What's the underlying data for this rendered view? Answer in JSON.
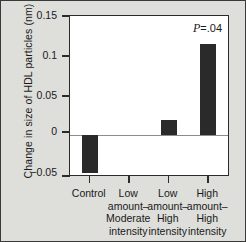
{
  "chart_data": {
    "type": "bar",
    "title": "",
    "xlabel": "",
    "ylabel": "Change in size of HDL particles (nm)",
    "categories": [
      "Control",
      "Low amount–Moderate intensity",
      "Low amount–High intensity",
      "High amount–High intensity"
    ],
    "category_lines": [
      [
        "Control"
      ],
      [
        "Low",
        "amount–",
        "Moderate",
        "intensity"
      ],
      [
        "Low",
        "amount–",
        "High",
        "intensity"
      ],
      [
        "High",
        "amount–",
        "High",
        "intensity"
      ]
    ],
    "values": [
      -0.048,
      0.0,
      0.019,
      0.115
    ],
    "ylim": [
      -0.05,
      0.15
    ],
    "yticks": [
      0.15,
      0.1,
      0.05,
      0,
      -0.05
    ],
    "ytick_labels": [
      "0.15",
      "0.1",
      "0.05",
      "0",
      "−0.05"
    ],
    "grid": false,
    "legend": "none",
    "annotations": [
      {
        "text_italic": "P",
        "text": "=.04",
        "series_index": 3
      }
    ],
    "bar_color": "#2a2a2a",
    "plot_background": "#ffffff",
    "figure_background": "#dededa",
    "axis_color": "#2b2b2b"
  }
}
